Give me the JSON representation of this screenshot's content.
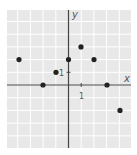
{
  "chart_data": {
    "type": "scatter",
    "title": "",
    "xlabel": "x",
    "ylabel": "y",
    "xlim": [
      -5,
      5
    ],
    "ylim": [
      -5,
      6
    ],
    "grid": true,
    "tick_labels": {
      "x": "1",
      "y": "1"
    },
    "points": [
      {
        "x": -4,
        "y": 2
      },
      {
        "x": -2,
        "y": 0
      },
      {
        "x": -1,
        "y": 1
      },
      {
        "x": 0,
        "y": 2
      },
      {
        "x": 1,
        "y": 3
      },
      {
        "x": 2,
        "y": 2
      },
      {
        "x": 3,
        "y": 0
      },
      {
        "x": 4,
        "y": -2
      }
    ]
  },
  "colors": {
    "grid_background": "#e8e8e8",
    "grid_line": "#ffffff",
    "axis": "#444444",
    "point": "#222222"
  }
}
